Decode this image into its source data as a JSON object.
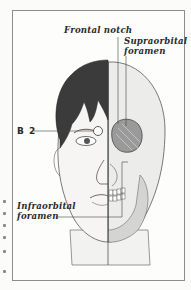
{
  "figure": {
    "labels": {
      "frontal_notch": "Frontal notch",
      "supraorbital_line1": "Supraorbital",
      "supraorbital_line2": "foramen",
      "b2": "B 2",
      "infraorbital_line1": "Infraorbital",
      "infraorbital_line2": "foramen"
    },
    "colors": {
      "frame": "#8c8c8c",
      "hair": "#3a3a3a",
      "skin": "#f4f3f1",
      "skull_shade": "#dadada",
      "line": "#444444"
    }
  }
}
